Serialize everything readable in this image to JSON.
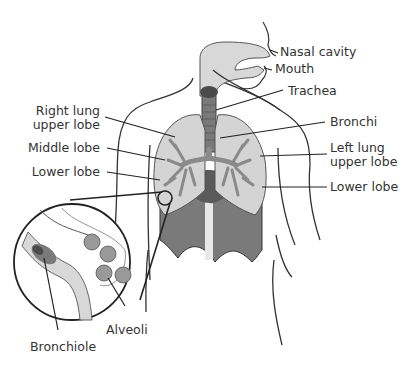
{
  "labels": {
    "nasal_cavity": "Nasal cavity",
    "mouth": "Mouth",
    "trachea": "Trachea",
    "bronchi": "Bronchi",
    "left_lung_upper_lobe_1": "Left lung",
    "left_lung_upper_lobe_2": "upper lobe",
    "lower_lobe_right_side": "Lower lobe",
    "right_lung_upper_lobe_1": "Right lung",
    "right_lung_upper_lobe_2": "upper lobe",
    "middle_lobe": "Middle lobe",
    "lower_lobe_left_side": "Lower lobe",
    "alveoli": "Alveoli",
    "bronchiole": "Bronchiole"
  },
  "colors": {
    "lung": "#d4d4d4",
    "bronchi": "#8a8a8a",
    "airway": "#d8d8d8",
    "trachea_dark": "#5a5a5a",
    "diaphragm": "#7a7a7a",
    "outline": "#222222",
    "background": "#ffffff"
  }
}
